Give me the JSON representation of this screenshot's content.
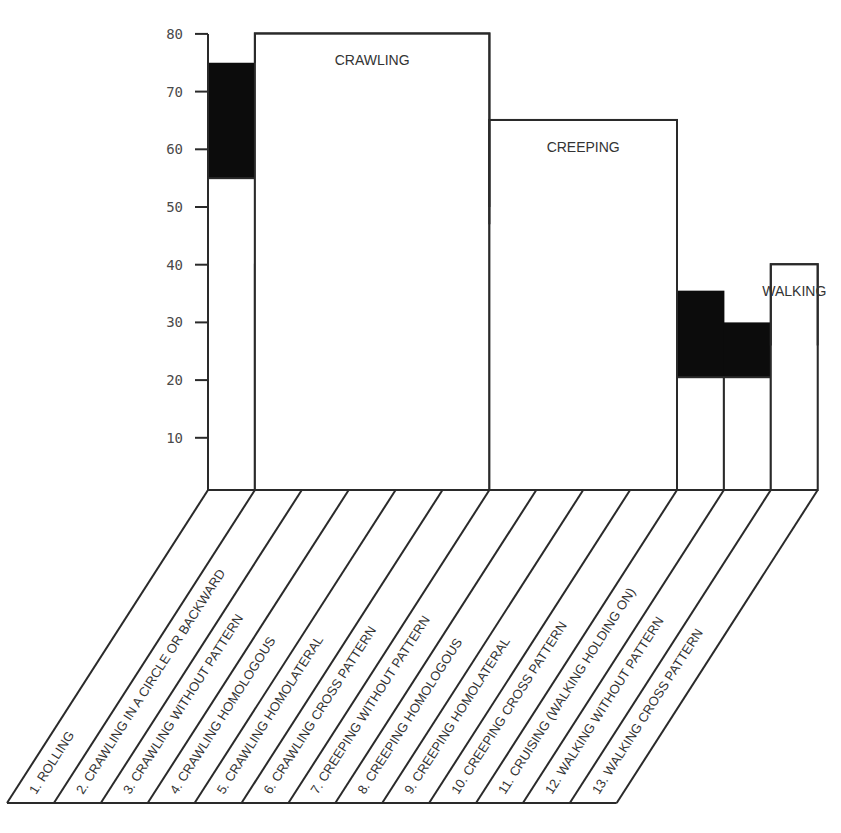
{
  "chart_data": {
    "type": "bar",
    "title": "",
    "xlabel": "",
    "ylabel": "",
    "ylim": [
      0,
      80
    ],
    "yticks": [
      10,
      20,
      30,
      40,
      50,
      60,
      70,
      80
    ],
    "grid": false,
    "stacked_style": "white lower bar with black range band above",
    "categories": [
      "1. ROLLING",
      "2. CRAWLING IN A CIRCLE OR BACKWARD",
      "3. CRAWLING WITHOUT PATTERN",
      "4. CRAWLING HOMOLOGOUS",
      "5. CRAWLING HOMOLATERAL",
      "6. CRAWLING CROSS PATTERN",
      "7. CREEPING WITHOUT PATTERN",
      "8. CREEPING HOMOLOGOUS",
      "9. CREEPING HOMOLATERAL",
      "10. CREEPING CROSS PATTERN",
      "11. CRUISING (WALKING HOLDING ON)",
      "12. WALKING WITHOUT PATTERN",
      "13. WALKING CROSS PATTERN"
    ],
    "series": [
      {
        "name": "range_start (white)",
        "color": "#ffffff",
        "values": [
          55,
          40,
          38,
          30,
          25.5,
          24,
          23,
          21.5,
          20.5,
          20.5,
          20.5,
          20.5,
          0
        ]
      },
      {
        "name": "range_end (black top)",
        "color": "#0c0c0c",
        "values": [
          75,
          75,
          67,
          60,
          54.5,
          50,
          47,
          45,
          45,
          45,
          35.5,
          30,
          26
        ]
      }
    ],
    "group_annotations": [
      {
        "label": "CRAWLING",
        "from_category": 2,
        "to_category": 6,
        "top": 80
      },
      {
        "label": "CREEPING",
        "from_category": 7,
        "to_category": 10,
        "top": 65
      },
      {
        "label": "WALKING",
        "from_category": 13,
        "to_category": 13,
        "top": 40
      }
    ]
  }
}
